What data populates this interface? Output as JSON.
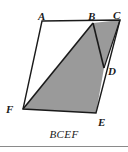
{
  "figure": {
    "caption": "BCEF",
    "background_color": "#ffffff",
    "stroke_color": "#1a1a1a",
    "shaded_fill_color": "#9a9a9a",
    "unshaded_fill_color": "#ffffff",
    "rule_color": "#8a8a8a",
    "labels": [
      {
        "name": "A",
        "text": "A",
        "x": 38,
        "y": 11
      },
      {
        "name": "B",
        "text": "B",
        "x": 88,
        "y": 11
      },
      {
        "name": "C",
        "text": "C",
        "x": 113,
        "y": 10
      },
      {
        "name": "D",
        "text": "D",
        "x": 108,
        "y": 66
      },
      {
        "name": "E",
        "text": "E",
        "x": 98,
        "y": 117
      },
      {
        "name": "F",
        "text": "F",
        "x": 6,
        "y": 104
      }
    ],
    "points": {
      "A": {
        "x": 42,
        "y": 21
      },
      "B": {
        "x": 93,
        "y": 23
      },
      "C": {
        "x": 120,
        "y": 20
      },
      "D": {
        "x": 104,
        "y": 68
      },
      "E": {
        "x": 96,
        "y": 113
      },
      "F": {
        "x": 23,
        "y": 109
      }
    },
    "shaded_polygon": "93,23 120,20 104,68 96,113 23,109",
    "unshaded_polygon": "42,21 93,23 23,109",
    "outline_polygon": "42,21 120,20 96,113 23,109",
    "segments": [
      {
        "name": "segment-B-F",
        "x1": 93,
        "y1": 23,
        "x2": 23,
        "y2": 109
      },
      {
        "name": "segment-B-D",
        "x1": 93,
        "y1": 23,
        "x2": 104,
        "y2": 68
      }
    ]
  }
}
